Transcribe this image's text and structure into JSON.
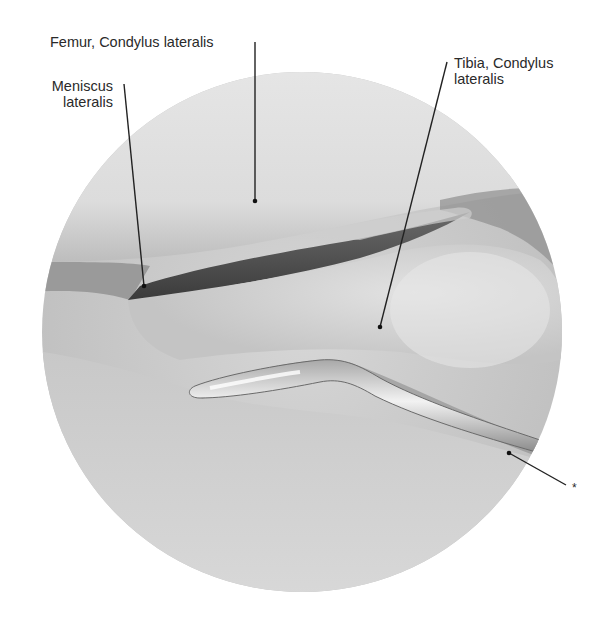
{
  "figure": {
    "type": "arthroscopic-view",
    "circle": {
      "cx": 302,
      "cy": 332,
      "r": 260
    }
  },
  "labels": [
    {
      "id": "femur",
      "text_lines": [
        "Femur, Condylus lateralis"
      ],
      "x": 50,
      "y": 32,
      "align": "left",
      "leader": {
        "x1": 255,
        "y1": 42,
        "x2": 255,
        "y2": 201
      }
    },
    {
      "id": "meniscus",
      "text_lines": [
        "Meniscus",
        "lateralis"
      ],
      "x": 40,
      "y": 80,
      "align": "right",
      "width": 73,
      "leader": {
        "x1": 124,
        "y1": 84,
        "x2": 144,
        "y2": 286
      }
    },
    {
      "id": "tibia",
      "text_lines": [
        "Tibia, Condylus",
        "lateralis"
      ],
      "x": 454,
      "y": 57,
      "align": "left",
      "leader": {
        "x1": 447,
        "y1": 62,
        "x2": 380,
        "y2": 327
      }
    },
    {
      "id": "probe",
      "text_lines": [
        "*"
      ],
      "x": 573,
      "y": 483,
      "align": "left",
      "leader": {
        "x1": 509,
        "y1": 453,
        "x2": 566,
        "y2": 485
      }
    }
  ]
}
